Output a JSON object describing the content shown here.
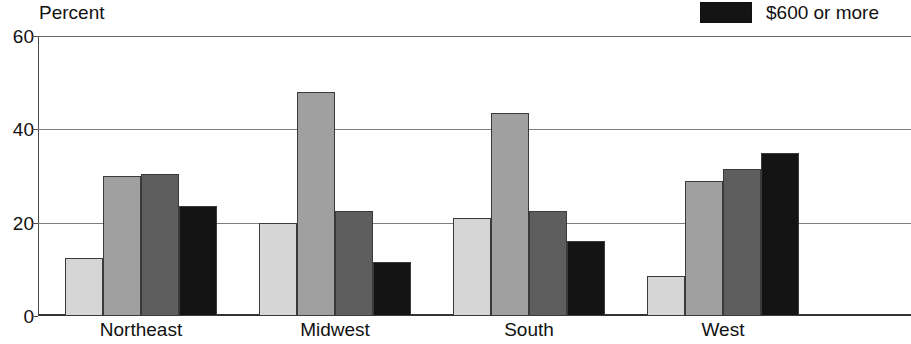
{
  "chart_data": {
    "type": "bar",
    "title": "",
    "ylabel": "Percent",
    "xlabel": "",
    "ylim": [
      0,
      60
    ],
    "yticks": [
      0,
      20,
      40,
      60
    ],
    "ytick_labels": [
      "0",
      "20",
      "40",
      "60"
    ],
    "grid": true,
    "grid_axis": "y",
    "legend_position": "top-right",
    "legend_visible_entries": [
      "$600 or more"
    ],
    "categories": [
      "Northeast",
      "Midwest",
      "South",
      "West"
    ],
    "series": [
      {
        "name": "series-1",
        "color": "#d6d6d6",
        "values": [
          12.5,
          20.0,
          21.0,
          8.5
        ]
      },
      {
        "name": "series-2",
        "color": "#a0a0a0",
        "values": [
          30.0,
          48.0,
          43.5,
          29.0
        ]
      },
      {
        "name": "series-3",
        "color": "#5e5e5e",
        "values": [
          30.5,
          22.5,
          22.5,
          31.5
        ]
      },
      {
        "name": "$600 or more",
        "color": "#141414",
        "values": [
          23.5,
          11.5,
          16.0,
          35.0
        ]
      }
    ]
  },
  "legend": {
    "entries": [
      {
        "label": "$600 or more",
        "color": "#141414"
      }
    ]
  },
  "axis": {
    "y_title": "Percent"
  },
  "colors": {
    "series_1": "#d6d6d6",
    "series_2": "#a0a0a0",
    "series_3": "#5e5e5e",
    "series_4": "#141414",
    "bar_outline": "#3a3a3a",
    "gridline": "#7d7d7d",
    "axis": "#333333",
    "text": "#111111",
    "background": "#ffffff"
  }
}
